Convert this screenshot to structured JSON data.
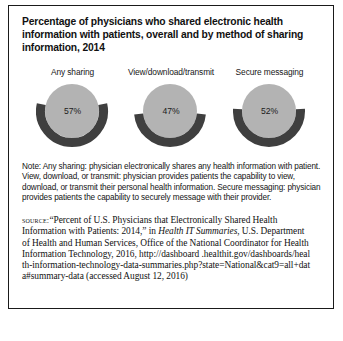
{
  "figure": {
    "title": "Percentage of physicians who shared electronic health information with patients, overall and by method of sharing information, 2014",
    "note": "Note: Any sharing: physician electronically shares any health information with patient. View, download, or transmit: physician provides patients the capability to view, download, or transmit their personal health information. Secure messaging: physician provides patients the capability to securely message with their provider.",
    "source": {
      "label": "source:",
      "text_part1": "“Percent of U.S. Physicians that Electronically Shared Health Information with Patients: 2014,” in ",
      "italic_part": "Health IT Summaries",
      "text_part2": ", U.S. Department of Health and Human Services, Office of the National Coordinator for Health Information Technology, 2016, http://dashboard .healthit.gov/dashboards/health-information-technology-data-summaries.php?state=National&cat9=all+data#summary-data (accessed August 12, 2016)"
    }
  },
  "chart_data": {
    "type": "pie",
    "title": "Percentage of physicians who shared electronic health information with patients, overall and by method of sharing information, 2014",
    "xlabel": "",
    "ylabel": "",
    "ylim": [
      0,
      100
    ],
    "categories": [
      "Any sharing",
      "View/download/transmit",
      "Secure messaging"
    ],
    "values": [
      57,
      47,
      52
    ],
    "value_labels": [
      "57%",
      "52%",
      "47%"
    ],
    "unit": "percent",
    "colors": {
      "arc": "#3f3f3f",
      "disc": "#b3b3b3",
      "text": "#1b1b1b"
    },
    "charts": [
      {
        "label": "Any sharing",
        "value": 57,
        "value_label": "57%"
      },
      {
        "label": "View/download/transmit",
        "value": 47,
        "value_label": "47%"
      },
      {
        "label": "Secure messaging",
        "value": 52,
        "value_label": "52%"
      }
    ]
  }
}
